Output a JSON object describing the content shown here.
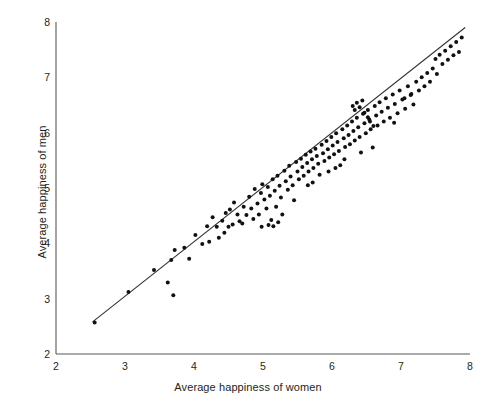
{
  "chart_data": {
    "type": "scatter",
    "title": "",
    "xlabel": "Average happiness of women",
    "ylabel": "Average happiness of men",
    "xlim": [
      2,
      8
    ],
    "ylim": [
      2,
      8
    ],
    "xticks": [
      2,
      3,
      4,
      5,
      6,
      7,
      8
    ],
    "yticks": [
      2,
      3,
      4,
      5,
      6,
      7,
      8
    ],
    "grid": false,
    "legend": "none",
    "marker_color": "#111111",
    "marker_size_px": 4,
    "line_color": "#333333",
    "axis_color": "#58595b",
    "trend_line": {
      "label": "regression line",
      "x_start": 2.53,
      "y_start": 2.58,
      "x_end": 7.93,
      "y_end": 7.9
    },
    "points": [
      [
        2.56,
        2.57
      ],
      [
        3.05,
        3.12
      ],
      [
        3.42,
        3.52
      ],
      [
        3.62,
        3.29
      ],
      [
        3.67,
        3.7
      ],
      [
        3.7,
        3.06
      ],
      [
        3.72,
        3.88
      ],
      [
        3.86,
        3.92
      ],
      [
        3.93,
        3.72
      ],
      [
        4.02,
        4.15
      ],
      [
        4.12,
        3.99
      ],
      [
        4.19,
        4.31
      ],
      [
        4.22,
        4.03
      ],
      [
        4.27,
        4.47
      ],
      [
        4.33,
        4.3
      ],
      [
        4.36,
        4.1
      ],
      [
        4.41,
        4.41
      ],
      [
        4.46,
        4.55
      ],
      [
        4.5,
        4.3
      ],
      [
        4.52,
        4.61
      ],
      [
        4.56,
        4.34
      ],
      [
        4.58,
        4.74
      ],
      [
        4.63,
        4.52
      ],
      [
        4.66,
        4.4
      ],
      [
        4.7,
        4.36
      ],
      [
        4.72,
        4.66
      ],
      [
        4.76,
        4.51
      ],
      [
        4.8,
        4.84
      ],
      [
        4.83,
        4.63
      ],
      [
        4.86,
        4.44
      ],
      [
        4.88,
        4.98
      ],
      [
        4.92,
        4.72
      ],
      [
        4.94,
        4.52
      ],
      [
        4.97,
        4.91
      ],
      [
        4.99,
        5.07
      ],
      [
        5.02,
        4.79
      ],
      [
        5.05,
        4.63
      ],
      [
        5.07,
        5.02
      ],
      [
        5.1,
        4.86
      ],
      [
        5.12,
        4.42
      ],
      [
        5.14,
        5.16
      ],
      [
        5.17,
        4.95
      ],
      [
        5.19,
        4.66
      ],
      [
        5.21,
        5.22
      ],
      [
        5.24,
        5.04
      ],
      [
        5.26,
        4.83
      ],
      [
        5.28,
        4.52
      ],
      [
        5.31,
        5.31
      ],
      [
        5.33,
        5.12
      ],
      [
        5.36,
        4.97
      ],
      [
        5.38,
        5.4
      ],
      [
        5.4,
        5.21
      ],
      [
        5.43,
        5.05
      ],
      [
        5.45,
        4.78
      ],
      [
        5.48,
        5.47
      ],
      [
        5.5,
        5.3
      ],
      [
        5.52,
        5.16
      ],
      [
        5.55,
        5.53
      ],
      [
        5.57,
        5.38
      ],
      [
        5.59,
        5.22
      ],
      [
        5.62,
        5.6
      ],
      [
        5.64,
        5.45
      ],
      [
        5.66,
        5.3
      ],
      [
        5.69,
        5.66
      ],
      [
        5.71,
        5.52
      ],
      [
        5.73,
        5.36
      ],
      [
        5.76,
        5.71
      ],
      [
        5.78,
        5.58
      ],
      [
        5.8,
        5.44
      ],
      [
        5.82,
        5.24
      ],
      [
        5.85,
        5.78
      ],
      [
        5.87,
        5.63
      ],
      [
        5.89,
        5.49
      ],
      [
        5.92,
        5.85
      ],
      [
        5.94,
        5.7
      ],
      [
        5.96,
        5.55
      ],
      [
        5.99,
        5.92
      ],
      [
        6.01,
        5.77
      ],
      [
        6.03,
        5.61
      ],
      [
        6.06,
        5.99
      ],
      [
        6.08,
        5.83
      ],
      [
        6.1,
        5.67
      ],
      [
        6.12,
        5.41
      ],
      [
        6.15,
        6.06
      ],
      [
        6.17,
        5.9
      ],
      [
        6.19,
        5.74
      ],
      [
        6.22,
        6.13
      ],
      [
        6.24,
        5.96
      ],
      [
        6.26,
        5.79
      ],
      [
        6.29,
        6.2
      ],
      [
        6.31,
        6.03
      ],
      [
        6.33,
        5.86
      ],
      [
        6.36,
        6.27
      ],
      [
        6.38,
        6.1
      ],
      [
        6.4,
        5.92
      ],
      [
        6.42,
        5.64
      ],
      [
        6.45,
        6.34
      ],
      [
        6.47,
        6.17
      ],
      [
        6.49,
        5.99
      ],
      [
        6.52,
        6.41
      ],
      [
        6.54,
        6.24
      ],
      [
        6.56,
        6.06
      ],
      [
        6.59,
        5.73
      ],
      [
        6.62,
        6.48
      ],
      [
        6.64,
        6.31
      ],
      [
        6.66,
        6.13
      ],
      [
        6.69,
        6.55
      ],
      [
        6.72,
        6.38
      ],
      [
        6.75,
        6.2
      ],
      [
        6.78,
        6.62
      ],
      [
        6.81,
        6.45
      ],
      [
        6.84,
        6.27
      ],
      [
        6.88,
        6.69
      ],
      [
        6.91,
        6.52
      ],
      [
        6.95,
        6.35
      ],
      [
        6.98,
        6.76
      ],
      [
        7.02,
        6.6
      ],
      [
        7.06,
        6.43
      ],
      [
        7.1,
        6.84
      ],
      [
        7.14,
        6.68
      ],
      [
        7.18,
        6.51
      ],
      [
        7.22,
        6.92
      ],
      [
        7.26,
        6.76
      ],
      [
        7.3,
        7.0
      ],
      [
        7.34,
        6.84
      ],
      [
        7.38,
        7.08
      ],
      [
        7.42,
        6.92
      ],
      [
        7.46,
        7.16
      ],
      [
        7.5,
        7.33
      ],
      [
        7.52,
        7.06
      ],
      [
        7.56,
        7.41
      ],
      [
        7.6,
        7.24
      ],
      [
        7.64,
        7.48
      ],
      [
        7.68,
        7.32
      ],
      [
        7.72,
        7.56
      ],
      [
        7.76,
        7.4
      ],
      [
        7.8,
        7.64
      ],
      [
        7.88,
        7.72
      ],
      [
        7.84,
        7.46
      ],
      [
        6.3,
        6.48
      ],
      [
        6.33,
        6.41
      ],
      [
        6.36,
        6.54
      ],
      [
        6.4,
        6.46
      ],
      [
        6.44,
        6.58
      ],
      [
        6.47,
        6.36
      ],
      [
        6.52,
        6.28
      ],
      [
        6.55,
        6.2
      ],
      [
        6.6,
        6.12
      ],
      [
        5.08,
        4.33
      ],
      [
        5.15,
        4.31
      ],
      [
        5.22,
        4.38
      ],
      [
        4.98,
        4.3
      ],
      [
        4.44,
        4.19
      ],
      [
        5.65,
        5.05
      ],
      [
        5.72,
        5.1
      ],
      [
        5.95,
        5.3
      ],
      [
        6.05,
        5.36
      ],
      [
        6.18,
        5.52
      ],
      [
        7.15,
        6.7
      ],
      [
        7.05,
        6.62
      ],
      [
        6.9,
        6.18
      ]
    ]
  }
}
